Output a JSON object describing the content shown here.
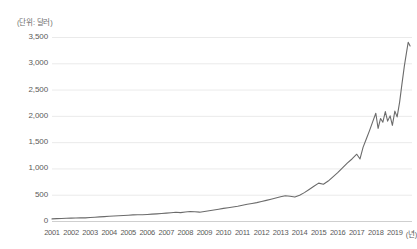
{
  "chart_data": {
    "type": "line",
    "title": "",
    "subtitle": "",
    "unit_label": "(단위: 달러)",
    "xlabel": "(년)",
    "ylabel": "",
    "xlim": [
      2001,
      2019.9
    ],
    "ylim": [
      0,
      3500
    ],
    "grid": true,
    "legend": null,
    "line_color": "#6b6b6b",
    "grid_color": "#e4e4e4",
    "axis_text_color": "#5a5a5a",
    "ytick_labels": [
      "3,500",
      "3,000",
      "2,500",
      "2,000",
      "1,500",
      "1,000",
      "500",
      "0"
    ],
    "ytick_values": [
      3500,
      3000,
      2500,
      2000,
      1500,
      1000,
      500,
      0
    ],
    "xtick_labels": [
      "2001",
      "2002",
      "2003",
      "2004",
      "2005",
      "2006",
      "2007",
      "2008",
      "2009",
      "2010",
      "2011",
      "2012",
      "2013",
      "2014",
      "2015",
      "2016",
      "2017",
      "2018",
      "2019"
    ],
    "xtick_values": [
      2001,
      2002,
      2003,
      2004,
      2005,
      2006,
      2007,
      2008,
      2009,
      2010,
      2011,
      2012,
      2013,
      2014,
      2015,
      2016,
      2017,
      2018,
      2019
    ],
    "series": [
      {
        "name": "value",
        "x": [
          2001.0,
          2001.25,
          2001.5,
          2001.75,
          2002.0,
          2002.25,
          2002.5,
          2002.75,
          2003.0,
          2003.25,
          2003.5,
          2003.75,
          2004.0,
          2004.25,
          2004.5,
          2004.75,
          2005.0,
          2005.25,
          2005.5,
          2005.75,
          2006.0,
          2006.25,
          2006.5,
          2006.75,
          2007.0,
          2007.25,
          2007.5,
          2007.75,
          2008.0,
          2008.25,
          2008.5,
          2008.75,
          2009.0,
          2009.25,
          2009.5,
          2009.75,
          2010.0,
          2010.25,
          2010.5,
          2010.75,
          2011.0,
          2011.25,
          2011.5,
          2011.75,
          2012.0,
          2012.25,
          2012.5,
          2012.75,
          2013.0,
          2013.25,
          2013.5,
          2013.75,
          2014.0,
          2014.25,
          2014.5,
          2014.75,
          2015.0,
          2015.25,
          2015.5,
          2015.75,
          2016.0,
          2016.25,
          2016.5,
          2016.75,
          2017.0,
          2017.17,
          2017.33,
          2017.5,
          2017.67,
          2017.83,
          2018.0,
          2018.12,
          2018.25,
          2018.37,
          2018.5,
          2018.62,
          2018.75,
          2018.87,
          2019.0,
          2019.12,
          2019.25,
          2019.37,
          2019.5,
          2019.6,
          2019.7,
          2019.8
        ],
        "values": [
          40,
          45,
          48,
          52,
          55,
          58,
          62,
          60,
          66,
          72,
          78,
          84,
          90,
          95,
          100,
          104,
          110,
          116,
          120,
          118,
          124,
          130,
          136,
          142,
          150,
          158,
          166,
          160,
          172,
          180,
          175,
          168,
          182,
          196,
          210,
          224,
          240,
          252,
          266,
          280,
          300,
          318,
          334,
          350,
          370,
          392,
          414,
          436,
          460,
          480,
          470,
          455,
          490,
          540,
          600,
          660,
          720,
          700,
          760,
          840,
          920,
          1010,
          1100,
          1180,
          1270,
          1180,
          1400,
          1560,
          1720,
          1880,
          2050,
          1760,
          1950,
          1880,
          2080,
          1900,
          2000,
          1820,
          2090,
          1980,
          2260,
          2600,
          2950,
          3180,
          3400,
          3330
        ]
      }
    ],
    "annotations": []
  }
}
